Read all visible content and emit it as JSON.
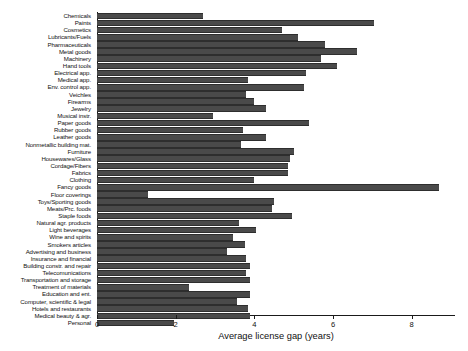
{
  "chart_data": {
    "type": "bar",
    "orientation": "horizontal",
    "title": "",
    "subtitle": "",
    "xlabel": "Average license gap (years)",
    "ylabel": "",
    "xlim": [
      0,
      9.1
    ],
    "xticks": [
      0,
      2,
      4,
      6,
      8
    ],
    "xticklabels": [
      "0",
      "2",
      "4",
      "6",
      "8"
    ],
    "grid": false,
    "legend": null,
    "bar_color": "#4a4a4a",
    "categories": [
      "Chemicals",
      "Paints",
      "Cosmetics",
      "Lubricants/Fuels",
      "Pharmaceuticals",
      "Metal goods",
      "Machinery",
      "Hand tools",
      "Electrical app.",
      "Medical app.",
      "Env. control app.",
      "Veichles",
      "Firearms",
      "Jewelry",
      "Musical instr.",
      "Paper goods",
      "Rubber goods",
      "Leather goods",
      "Nonmetallic building mat.",
      "Furniture",
      "Housewares/Glass",
      "Cordage/Fibers",
      "Fabrics",
      "Clothing",
      "Fancy goods",
      "Floor coverings",
      "Toys/Sporting goods",
      "Meats/Prc. foods",
      "Staple foods",
      "Natural agr. products",
      "Light beverages",
      "Wine and spirits",
      "Smokers articles",
      "Advertising and business",
      "Insurance and financial",
      "Building constr. and repair",
      "Telecomunications",
      "Transportation and storage",
      "Treatment of materials",
      "Education and ent.",
      "Computer, scientific & legal",
      "Hotels and restaurants",
      "Medical beauty & agr.",
      "Personal"
    ],
    "values": [
      2.7,
      7.05,
      4.7,
      5.1,
      5.8,
      6.6,
      5.7,
      6.1,
      5.3,
      3.85,
      5.25,
      3.8,
      4.0,
      4.3,
      2.95,
      5.4,
      3.7,
      4.3,
      3.65,
      5.0,
      4.9,
      4.85,
      4.85,
      4.0,
      8.7,
      1.3,
      4.5,
      4.45,
      4.95,
      3.6,
      4.05,
      3.45,
      3.75,
      3.3,
      3.8,
      3.9,
      3.8,
      3.9,
      2.35,
      3.9,
      3.55,
      3.85,
      3.9,
      1.95
    ]
  }
}
